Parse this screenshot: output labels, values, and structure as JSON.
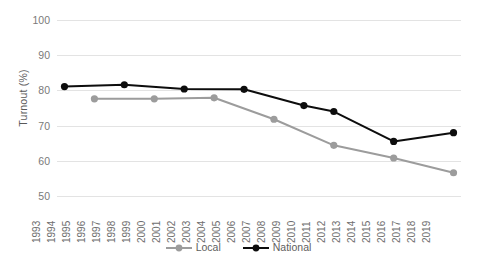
{
  "chart_data": {
    "type": "line",
    "title": "",
    "xlabel": "",
    "ylabel": "Turnout (%)",
    "ylim": [
      50,
      100
    ],
    "yticks": [
      50,
      60,
      70,
      80,
      90,
      100
    ],
    "grid": true,
    "legend_position": "bottom",
    "categories": [
      "1993",
      "1994",
      "1995",
      "1996",
      "1997",
      "1998",
      "1999",
      "2000",
      "2001",
      "2002",
      "2003",
      "2004",
      "2005",
      "2006",
      "2007",
      "2008",
      "2009",
      "2010",
      "2011",
      "2012",
      "2013",
      "2014",
      "2015",
      "2016",
      "2017",
      "2018",
      "2019"
    ],
    "series": [
      {
        "name": "Local",
        "color": "#9c9c9c",
        "points": [
          {
            "x": "1995",
            "y": 77.6
          },
          {
            "x": "1999",
            "y": 77.6
          },
          {
            "x": "2003",
            "y": 77.9
          },
          {
            "x": "2007",
            "y": 71.8
          },
          {
            "x": "2011",
            "y": 64.4
          },
          {
            "x": "2015",
            "y": 60.8
          },
          {
            "x": "2019",
            "y": 56.6
          }
        ]
      },
      {
        "name": "National",
        "color": "#0d0d0d",
        "points": [
          {
            "x": "1993",
            "y": 81.1
          },
          {
            "x": "1997",
            "y": 81.6
          },
          {
            "x": "2001",
            "y": 80.4
          },
          {
            "x": "2005",
            "y": 80.3
          },
          {
            "x": "2009",
            "y": 75.7
          },
          {
            "x": "2011",
            "y": 74.0
          },
          {
            "x": "2015",
            "y": 65.5
          },
          {
            "x": "2019",
            "y": 68.0
          }
        ]
      }
    ]
  },
  "legend": {
    "items": [
      {
        "label": "Local",
        "color": "#9c9c9c"
      },
      {
        "label": "National",
        "color": "#0d0d0d"
      }
    ]
  }
}
